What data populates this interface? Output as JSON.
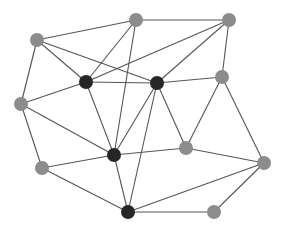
{
  "diagram": {
    "type": "network-graph",
    "colors": {
      "background": "#ffffff",
      "edge": "#555555",
      "node_gray": "#8c8c8c",
      "node_dark": "#262626"
    },
    "nodes": [
      {
        "id": "A",
        "x": 37,
        "y": 40,
        "kind": "gray"
      },
      {
        "id": "B",
        "x": 136,
        "y": 20,
        "kind": "gray"
      },
      {
        "id": "C",
        "x": 229,
        "y": 20,
        "kind": "gray"
      },
      {
        "id": "D",
        "x": 86,
        "y": 82,
        "kind": "dark"
      },
      {
        "id": "E",
        "x": 157,
        "y": 83,
        "kind": "dark"
      },
      {
        "id": "F",
        "x": 222,
        "y": 77,
        "kind": "gray"
      },
      {
        "id": "G",
        "x": 21,
        "y": 104,
        "kind": "gray"
      },
      {
        "id": "H",
        "x": 114,
        "y": 155,
        "kind": "dark"
      },
      {
        "id": "I",
        "x": 186,
        "y": 148,
        "kind": "gray"
      },
      {
        "id": "J",
        "x": 42,
        "y": 168,
        "kind": "gray"
      },
      {
        "id": "K",
        "x": 264,
        "y": 163,
        "kind": "gray"
      },
      {
        "id": "L",
        "x": 128,
        "y": 212,
        "kind": "dark"
      },
      {
        "id": "M",
        "x": 214,
        "y": 212,
        "kind": "gray"
      }
    ],
    "edges": [
      [
        "A",
        "B"
      ],
      [
        "A",
        "D"
      ],
      [
        "A",
        "E"
      ],
      [
        "A",
        "G"
      ],
      [
        "B",
        "C"
      ],
      [
        "B",
        "D"
      ],
      [
        "B",
        "H"
      ],
      [
        "C",
        "D"
      ],
      [
        "C",
        "E"
      ],
      [
        "C",
        "F"
      ],
      [
        "D",
        "E"
      ],
      [
        "D",
        "G"
      ],
      [
        "D",
        "H"
      ],
      [
        "E",
        "F"
      ],
      [
        "E",
        "H"
      ],
      [
        "E",
        "I"
      ],
      [
        "E",
        "L"
      ],
      [
        "F",
        "I"
      ],
      [
        "F",
        "K"
      ],
      [
        "G",
        "H"
      ],
      [
        "G",
        "J"
      ],
      [
        "H",
        "J"
      ],
      [
        "H",
        "I"
      ],
      [
        "H",
        "L"
      ],
      [
        "I",
        "K"
      ],
      [
        "J",
        "L"
      ],
      [
        "K",
        "L"
      ],
      [
        "K",
        "M"
      ],
      [
        "L",
        "M"
      ]
    ]
  }
}
